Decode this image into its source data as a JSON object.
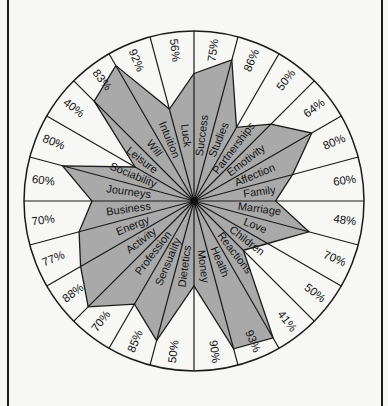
{
  "chart_data": {
    "type": "radar",
    "title": "",
    "direction": "clockwise-from-top",
    "value_unit": "%",
    "rmax": 100,
    "grid": false,
    "legend": "none",
    "categories": [
      "Success",
      "Studies",
      "Partnerships",
      "Emotivity",
      "Affection",
      "Family",
      "Marriage",
      "Love",
      "Children",
      "Reactions",
      "Health",
      "Money",
      "Dietetics",
      "Sensuality",
      "Profession",
      "Activity",
      "Energy",
      "Business",
      "Journeys",
      "Sociability",
      "Leisure",
      "Will",
      "Intuition",
      "Luck"
    ],
    "values": [
      75,
      86,
      50,
      64,
      80,
      60,
      48,
      70,
      50,
      41,
      93,
      90,
      50,
      85,
      70,
      88,
      77,
      70,
      60,
      80,
      40,
      83,
      92,
      56
    ],
    "value_labels": [
      "75%",
      "86%",
      "50%",
      "64%",
      "80%",
      "60%",
      "48%",
      "70%",
      "50%",
      "41%",
      "93%",
      "90%",
      "50%",
      "85%",
      "70%",
      "88%",
      "77%",
      "70%",
      "60%",
      "80%",
      "40%",
      "83%",
      "92%",
      "56%"
    ]
  },
  "colors": {
    "fill": "#a9a9a9",
    "stroke": "#1a1a1a",
    "background": "#f7f7f5"
  }
}
